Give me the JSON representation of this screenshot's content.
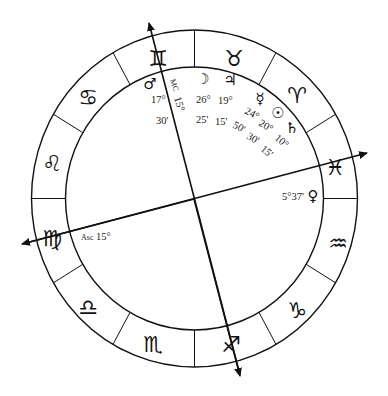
{
  "chart": {
    "center": [
      194,
      199
    ],
    "outer_radius": [
      163,
      169
    ],
    "inner_radius": [
      129,
      132
    ],
    "line_color": "#111111",
    "background": "#ffffff"
  },
  "zodiac": [
    {
      "name": "gemini",
      "glyph": "♊",
      "x": 158,
      "y": 58
    },
    {
      "name": "taurus",
      "glyph": "♉",
      "x": 234,
      "y": 58
    },
    {
      "name": "aries",
      "glyph": "♈",
      "x": 297,
      "y": 93
    },
    {
      "name": "pisces",
      "glyph": "♓",
      "x": 335,
      "y": 167
    },
    {
      "name": "aquarius",
      "glyph": "♒",
      "x": 338,
      "y": 243
    },
    {
      "name": "capricorn",
      "glyph": "♑",
      "x": 297,
      "y": 310
    },
    {
      "name": "sagittarius",
      "glyph": "♐",
      "x": 232,
      "y": 346
    },
    {
      "name": "scorpio",
      "glyph": "♏",
      "x": 153,
      "y": 346
    },
    {
      "name": "libra",
      "glyph": "♎",
      "x": 89,
      "y": 307
    },
    {
      "name": "virgo",
      "glyph": "♍",
      "x": 52,
      "y": 240
    },
    {
      "name": "leo",
      "glyph": "♌",
      "x": 52,
      "y": 163
    },
    {
      "name": "cancer",
      "glyph": "♋",
      "x": 88,
      "y": 97
    }
  ],
  "planets": [
    {
      "name": "mars",
      "glyph": "♂",
      "x": 148,
      "y": 92,
      "degree": "17°",
      "minute": "30'"
    },
    {
      "name": "moon",
      "glyph": "☽",
      "x": 203,
      "y": 84,
      "degree": "26°",
      "minute": "25'"
    },
    {
      "name": "jupiter",
      "glyph": "♃",
      "x": 230,
      "y": 84,
      "degree": "19°",
      "minute": "15'"
    },
    {
      "name": "mercury",
      "glyph": "☿",
      "x": 260,
      "y": 107,
      "degree": "24°",
      "minute": "50'"
    },
    {
      "name": "sun",
      "glyph": "☉",
      "x": 278,
      "y": 121,
      "degree": "20°",
      "minute": "30'"
    },
    {
      "name": "saturn",
      "glyph": "♄",
      "x": 292,
      "y": 137,
      "degree": "10°",
      "minute": "15'"
    },
    {
      "name": "venus",
      "glyph": "♀",
      "x": 313,
      "y": 197,
      "degree": "5°37'"
    }
  ],
  "angles": {
    "mc": {
      "label": "MC",
      "degree": "15°"
    },
    "asc": {
      "label": "Asc",
      "degree": "15°"
    }
  },
  "labels": {
    "mars_deg": "17°",
    "mars_min": "30'",
    "mc_label": "MC",
    "mc_deg": "15°",
    "moon_deg": "26°",
    "moon_min": "25'",
    "jupiter_deg": "19°",
    "jupiter_min": "15'",
    "mercury_deg": "24°",
    "mercury_min": "50'",
    "sun_deg": "20°",
    "sun_min": "30'",
    "saturn_deg": "10°",
    "saturn_min": "15'",
    "venus_pos": "5°37'",
    "asc_label": "Asc",
    "asc_deg": "15°",
    "glyph_gemini": "♊",
    "glyph_taurus": "♉",
    "glyph_aries": "♈",
    "glyph_pisces": "♓",
    "glyph_aquarius": "♒",
    "glyph_capricorn": "♑",
    "glyph_sagittarius": "♐",
    "glyph_scorpio": "♏",
    "glyph_libra": "♎",
    "glyph_virgo": "♍",
    "glyph_leo": "♌",
    "glyph_cancer": "♋",
    "glyph_mars": "♂",
    "glyph_moon": "☽",
    "glyph_jupiter": "♃",
    "glyph_mercury": "☿",
    "glyph_sun": "☉",
    "glyph_saturn": "♄",
    "glyph_venus": "♀"
  }
}
